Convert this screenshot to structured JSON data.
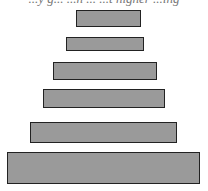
{
  "diagram": {
    "type": "pyramid-stack",
    "top_text_cropped": "...y g... ...h ... ...t higher ...ing",
    "fill_color": "#9a9a9a",
    "border_color": "#222222",
    "bars": [
      {
        "x": 76,
        "y": 10,
        "w": 65,
        "h": 17
      },
      {
        "x": 66,
        "y": 37,
        "w": 78,
        "h": 14
      },
      {
        "x": 53,
        "y": 62,
        "w": 104,
        "h": 18
      },
      {
        "x": 43,
        "y": 89,
        "w": 122,
        "h": 19
      },
      {
        "x": 30,
        "y": 122,
        "w": 147,
        "h": 21
      },
      {
        "x": 7,
        "y": 152,
        "w": 193,
        "h": 32
      }
    ]
  }
}
